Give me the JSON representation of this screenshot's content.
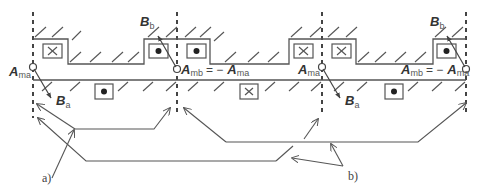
{
  "figure": {
    "type": "electrical machine winding / flux diagram",
    "labels": {
      "A_ma": {
        "main": "A",
        "sub": "ma"
      },
      "A_mb_eq": {
        "main": "A",
        "sub": "mb",
        "equals": "= −",
        "rhs_main": "A",
        "rhs_sub": "ma"
      },
      "B_a": {
        "main": "B",
        "sub": "a"
      },
      "B_b": {
        "main": "B",
        "sub": "b"
      },
      "callout_a": "a)",
      "callout_b": "b)"
    },
    "conductors_upper": [
      "cross",
      "dot",
      "dot",
      "cross",
      "cross",
      "dot"
    ],
    "conductors_lower": [
      "dot",
      "cross",
      "dot"
    ],
    "colors": {
      "line": "#555555",
      "text": "#333333",
      "background": "#ffffff"
    }
  }
}
